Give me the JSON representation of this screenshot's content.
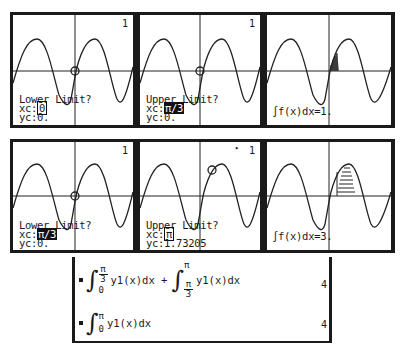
{
  "screens": {
    "row1": {
      "panel1": {
        "number": "1",
        "prompt": "Lower Limit?",
        "xc_label": "xc:",
        "xc_value": "0",
        "yc_label": "yc:",
        "yc_value": "0."
      },
      "panel2": {
        "number": "1",
        "prompt": "Upper Limit?",
        "xc_label": "xc:",
        "xc_value": "π/3",
        "yc_label": "yc:",
        "yc_value": "0."
      },
      "panel3": {
        "result": "∫f(x)dx=1."
      }
    },
    "row2": {
      "panel1": {
        "number": "1",
        "prompt": "Lower Limit?",
        "xc_label": "xc:",
        "xc_value": "π/3",
        "yc_label": "yc:",
        "yc_value": "0."
      },
      "panel2": {
        "number": "1",
        "busy": "▸",
        "prompt": "Upper Limit?",
        "xc_label": "xc:",
        "xc_value": "π",
        "yc_label": "yc:",
        "yc_value": "1.73205"
      },
      "panel3": {
        "result": "∫f(x)dx=3."
      }
    }
  },
  "home": {
    "entry1": {
      "int1_upper_num": "π",
      "int1_upper_den": "3",
      "int1_lower": "0",
      "int1_body": "y1(x)dx +",
      "int2_upper": "π",
      "int2_lower_num": "π",
      "int2_lower_den": "3",
      "int2_body": "y1(x)dx",
      "result": "4"
    },
    "entry2": {
      "upper": "π",
      "lower": "0",
      "body": "y1(x)dx",
      "result": "4"
    },
    "integral_sign": "∫"
  }
}
